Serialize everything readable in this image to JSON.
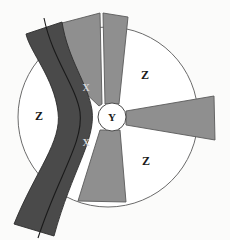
{
  "diagram": {
    "canvas": {
      "width": 230,
      "height": 240,
      "background": "#fbfbfa"
    },
    "colors": {
      "outline": "#6b6b6b",
      "band_dark": "#4a4a4a",
      "blade_medium": "#8f8f8f",
      "region_light": "#ffffff",
      "label_dark": "#1a1a1a",
      "label_light": "#d8d8d8",
      "curve_line": "#1a1a1a"
    },
    "outer_circle": {
      "cx": 108,
      "cy": 117,
      "r": 90,
      "fill": "#ffffff",
      "stroke": "#6b6b6b"
    },
    "hub_circle": {
      "cx": 112,
      "cy": 117,
      "r": 14,
      "fill": "#ffffff",
      "stroke": "#4a4a4a"
    },
    "labels": {
      "hub": {
        "text": "Y",
        "x": 112,
        "y": 118,
        "size": 11,
        "color": "#1a1a1a"
      },
      "band_upper": {
        "text": "X",
        "x": 86,
        "y": 89,
        "size": 10,
        "color": "#d8d8d8"
      },
      "band_lower": {
        "text": "X",
        "x": 86,
        "y": 144,
        "size": 10,
        "color": "#d8d8d8"
      },
      "region_left": {
        "text": "Z",
        "x": 39,
        "y": 117,
        "size": 12,
        "color": "#1a1a1a"
      },
      "region_top_right": {
        "text": "Z",
        "x": 145,
        "y": 76,
        "size": 12,
        "color": "#1a1a1a"
      },
      "region_bottom_right": {
        "text": "Z",
        "x": 146,
        "y": 162,
        "size": 12,
        "color": "#1a1a1a"
      }
    },
    "shapes": {
      "blade_upper_left": {
        "name": "blade-upper-left",
        "fill": "#8f8f8f",
        "points": "36,46 62,23 100,13 102,104 99,106"
      },
      "blade_upper_right": {
        "name": "blade-upper-right",
        "fill": "#8f8f8f",
        "points": "103,13 128,17 118,104 105,104"
      },
      "blade_right": {
        "name": "blade-right",
        "fill": "#8f8f8f",
        "points": "126,111 214,96 215,140 126,125"
      },
      "blade_lower": {
        "name": "blade-lower",
        "fill": "#8f8f8f",
        "points": "100,130 120,130 126,202 78,201"
      },
      "band_s_curve": {
        "name": "band-s-curve",
        "fill": "#4a4a4a",
        "path": "M 62,22 C 68,60 88,84 92,110 C 96,140 72,170 54,236 L 14,224 C 36,170 62,142 58,112 C 54,78 30,52 26,34 Z"
      },
      "band_inner_curve": {
        "name": "band-inner-curve-line",
        "stroke": "#1a1a1a",
        "path": "M 44,18 C 52,58 76,86 80,112 C 84,142 58,176 38,238"
      }
    }
  }
}
